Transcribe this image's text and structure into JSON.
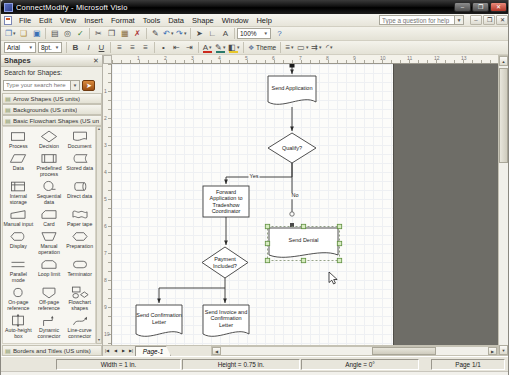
{
  "window": {
    "title": "ConnectModify - Microsoft Visio",
    "buttons": [
      {
        "name": "minimize",
        "glyph": "–"
      },
      {
        "name": "maximize",
        "glyph": "❐"
      },
      {
        "name": "close",
        "glyph": "✕"
      }
    ]
  },
  "menu": {
    "items": [
      "File",
      "Edit",
      "View",
      "Insert",
      "Format",
      "Tools",
      "Data",
      "Shape",
      "Window",
      "Help"
    ],
    "question_placeholder": "Type a question for help",
    "doc_buttons": [
      {
        "name": "document-minimize",
        "glyph": "–"
      },
      {
        "name": "document-restore",
        "glyph": "❐"
      },
      {
        "name": "document-close",
        "glyph": "✕"
      }
    ]
  },
  "toolbars": {
    "standard": {
      "zoom_value": "100%",
      "items": [
        {
          "name": "new",
          "glyph": "❐",
          "dd": true,
          "color": "#3b6fb5"
        },
        {
          "name": "open",
          "glyph": "❏",
          "color": "#b08a2e"
        },
        {
          "name": "save",
          "glyph": "▣",
          "color": "#3b6fb5"
        },
        {
          "sep": true
        },
        {
          "name": "print",
          "glyph": "▤"
        },
        {
          "name": "print-preview",
          "glyph": "◎"
        },
        {
          "name": "spelling",
          "glyph": "✓",
          "color": "#2e7d32"
        },
        {
          "sep": true
        },
        {
          "name": "cut",
          "glyph": "✂"
        },
        {
          "name": "copy",
          "glyph": "❒"
        },
        {
          "name": "paste",
          "glyph": "▦",
          "color": "#8a6d3b"
        },
        {
          "name": "delete",
          "glyph": "✗",
          "color": "#a33"
        },
        {
          "sep": true
        },
        {
          "name": "format-painter",
          "glyph": "✎"
        },
        {
          "name": "undo",
          "glyph": "↶",
          "dd": true,
          "color": "#3b6fb5"
        },
        {
          "name": "redo",
          "glyph": "↷",
          "dd": true,
          "color": "#3b6fb5"
        },
        {
          "sep": true
        },
        {
          "name": "pointer-tool",
          "glyph": "➤"
        },
        {
          "name": "connector-tool",
          "glyph": "∟"
        },
        {
          "name": "text-tool",
          "glyph": "A"
        },
        {
          "sep": true
        },
        {
          "type": "zoom-combo",
          "name": "zoom-combo"
        },
        {
          "name": "help",
          "glyph": "?",
          "color": "#3b6fb5"
        }
      ]
    },
    "formatting": {
      "font_name": "Arial",
      "font_size": "8pt.",
      "theme_label": "Theme",
      "items": [
        {
          "type": "combo",
          "name": "font-name-combo",
          "valuekey": "font_name",
          "w": 32
        },
        {
          "type": "combo",
          "name": "font-size-combo",
          "valuekey": "font_size",
          "w": 24
        },
        {
          "sep": true
        },
        {
          "name": "bold",
          "glyph": "B",
          "bold": true
        },
        {
          "name": "italic",
          "glyph": "I",
          "italic": true
        },
        {
          "name": "underline",
          "glyph": "U",
          "underline": true
        },
        {
          "sep": true
        },
        {
          "name": "align-left",
          "glyph": "≡"
        },
        {
          "name": "align-center",
          "glyph": "≡"
        },
        {
          "name": "align-right",
          "glyph": "≡"
        },
        {
          "sep": true
        },
        {
          "name": "bullets",
          "glyph": "•"
        },
        {
          "name": "decrease-indent",
          "glyph": "⇤"
        },
        {
          "name": "increase-indent",
          "glyph": "⇥"
        },
        {
          "sep": true
        },
        {
          "name": "font-color",
          "glyph": "A",
          "dd": true,
          "bar": "#cc2a1e"
        },
        {
          "name": "line-color",
          "glyph": "✎",
          "dd": true,
          "bar": "#2a7a6a"
        },
        {
          "name": "fill-color",
          "glyph": "◧",
          "dd": true,
          "bar": "#e8c72a"
        },
        {
          "sep": true
        },
        {
          "type": "theme",
          "name": "theme-button"
        },
        {
          "sep": true
        },
        {
          "name": "line-weight",
          "glyph": "≡",
          "dd": true
        },
        {
          "name": "line-pattern",
          "glyph": "▭",
          "dd": true
        },
        {
          "name": "line-ends",
          "glyph": "⇉",
          "dd": true
        },
        {
          "name": "corner-rounding",
          "glyph": "◜",
          "dd": true
        }
      ]
    }
  },
  "shapes_panel": {
    "title": "Shapes",
    "close_glyph": "✕",
    "search_label": "Search for Shapes:",
    "search_placeholder": "Type your search here",
    "search_go_glyph": "➤",
    "sections": [
      {
        "label": "Arrow Shapes (US units)",
        "expanded": false
      },
      {
        "label": "Backgrounds (US units)",
        "expanded": false
      },
      {
        "label": "Basic Flowchart Shapes (US units)",
        "expanded": true
      }
    ],
    "bottom_section": {
      "label": "Borders and Titles (US units)",
      "expanded": false
    },
    "stencil_items": [
      {
        "label": "Process",
        "type": "process"
      },
      {
        "label": "Decision",
        "type": "decision"
      },
      {
        "label": "Document",
        "type": "document"
      },
      {
        "label": "Data",
        "type": "data"
      },
      {
        "label": "Predefined process",
        "type": "predefined-process"
      },
      {
        "label": "Stored data",
        "type": "stored-data"
      },
      {
        "label": "Internal storage",
        "type": "internal-storage"
      },
      {
        "label": "Sequential data",
        "type": "sequential-data"
      },
      {
        "label": "Direct data",
        "type": "direct-data"
      },
      {
        "label": "Manual input",
        "type": "manual-input"
      },
      {
        "label": "Card",
        "type": "card"
      },
      {
        "label": "Paper tape",
        "type": "paper-tape"
      },
      {
        "label": "Display",
        "type": "display"
      },
      {
        "label": "Manual operation",
        "type": "manual-operation"
      },
      {
        "label": "Preparation",
        "type": "preparation"
      },
      {
        "label": "Parallel mode",
        "type": "parallel-mode"
      },
      {
        "label": "Loop limit",
        "type": "loop-limit"
      },
      {
        "label": "Terminator",
        "type": "terminator"
      },
      {
        "label": "On-page reference",
        "type": "on-page-reference"
      },
      {
        "label": "Off-page reference",
        "type": "off-page-reference"
      },
      {
        "label": "Flowchart shapes",
        "type": "flowchart-shapes"
      },
      {
        "label": "Auto-height box",
        "type": "auto-height-box"
      },
      {
        "label": "Dynamic connector",
        "type": "dynamic-connector"
      },
      {
        "label": "Line-curve connector",
        "type": "line-curve-connector"
      },
      {
        "label": "",
        "type": "control-transfer"
      },
      {
        "label": "",
        "type": "annotation"
      }
    ]
  },
  "rulers": {
    "horizontal": [
      "1",
      "2",
      "3",
      "4",
      "5",
      "6",
      "7",
      "8",
      "9",
      "10",
      "11",
      "12",
      "13"
    ],
    "vertical": [
      "1",
      "2",
      "3",
      "4",
      "5",
      "6",
      "7",
      "8",
      "9",
      "10"
    ]
  },
  "page": {
    "tab": "Page-1",
    "nav_glyphs": [
      "|◀",
      "◀",
      "▶",
      "▶|"
    ]
  },
  "flowchart": {
    "nodes": [
      {
        "id": "send-application",
        "type": "document",
        "label": "Send Application",
        "x": 267,
        "y": 76,
        "w": 48,
        "h": 30
      },
      {
        "id": "qualify",
        "type": "decision",
        "label": "Qualify?",
        "x": 267,
        "y": 133,
        "w": 48,
        "h": 30
      },
      {
        "id": "forward-application",
        "type": "process",
        "label": "Forward Application to Tradeshow Coordinator",
        "x": 202,
        "y": 186,
        "w": 46,
        "h": 31
      },
      {
        "id": "payment-included",
        "type": "decision",
        "label": "Payment Included?",
        "x": 201,
        "y": 247,
        "w": 46,
        "h": 31
      },
      {
        "id": "send-denial",
        "type": "document",
        "label": "Send Denial",
        "x": 268,
        "y": 228,
        "w": 69,
        "h": 31,
        "selected": true
      },
      {
        "id": "send-confirmation-letter",
        "type": "document",
        "label": "Send Confirmation Letter",
        "x": 135,
        "y": 305,
        "w": 46,
        "h": 33
      },
      {
        "id": "send-invoice",
        "type": "document",
        "label": "Send Invoice and Confirmation Letter",
        "x": 202,
        "y": 305,
        "w": 46,
        "h": 33
      }
    ],
    "edges": [
      {
        "name": "incoming-connector",
        "points": [
          [
            291,
            65
          ],
          [
            291,
            74
          ]
        ],
        "arrow": true,
        "start_square": true
      },
      {
        "name": "application-to-qualify",
        "points": [
          [
            291,
            107
          ],
          [
            291,
            131
          ]
        ],
        "arrow": true
      },
      {
        "name": "qualify-yes",
        "label": "Yes",
        "label_pos": [
          253,
          177
        ],
        "points": [
          [
            291,
            163
          ],
          [
            291,
            177
          ],
          [
            225,
            177
          ],
          [
            225,
            184
          ]
        ],
        "arrow": true
      },
      {
        "name": "qualify-no",
        "label": "No",
        "label_pos": [
          294,
          196
        ],
        "points": [
          [
            291,
            163
          ],
          [
            291,
            212
          ]
        ],
        "arrow": false,
        "end_circle": true
      },
      {
        "name": "forward-to-payment",
        "points": [
          [
            225,
            217
          ],
          [
            225,
            245
          ]
        ],
        "arrow": true
      },
      {
        "name": "payment-to-invoice",
        "points": [
          [
            224,
            278
          ],
          [
            224,
            303
          ]
        ],
        "arrow": true
      },
      {
        "name": "payment-to-confirmation",
        "points": [
          [
            224,
            288
          ],
          [
            158,
            288
          ],
          [
            158,
            303
          ]
        ],
        "arrow": true
      }
    ],
    "markers": [
      {
        "shape": "square",
        "x": 291,
        "y": 225
      }
    ],
    "cursor": {
      "x": 328,
      "y": 272
    }
  },
  "status": {
    "width": "Width = 1 in.",
    "height": "Height = 0.75 in.",
    "angle": "Angle = 0°",
    "page": "Page 1/1"
  },
  "colors": {
    "titlebar": "#1c1c1c",
    "toolbar_bg": "#eceadf",
    "out_of_page": "#6e6d67",
    "grid_line": "#dfe3e8",
    "shape_stroke": "#3d3d3d",
    "selection_handle_fill": "#d7ecc0",
    "selection_handle_border": "#5f8f3e",
    "close_button": "#b13527"
  }
}
